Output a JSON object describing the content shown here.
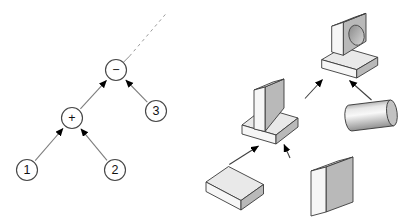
{
  "diagram": {
    "type": "csg-expression-tree",
    "tree_nodes": [
      {
        "id": "minus",
        "label": "−",
        "role": "difference-operator"
      },
      {
        "id": "plus",
        "label": "+",
        "role": "union-operator"
      },
      {
        "id": "one",
        "label": "1",
        "role": "operand"
      },
      {
        "id": "two",
        "label": "2",
        "role": "operand"
      },
      {
        "id": "three",
        "label": "3",
        "role": "operand"
      }
    ],
    "shapes": [
      {
        "id": "base-slab",
        "name": "flat-block-operand-1"
      },
      {
        "id": "upright-slab",
        "name": "upright-block-operand-2"
      },
      {
        "id": "pedestal",
        "name": "union-result-pedestal"
      },
      {
        "id": "cylinder",
        "name": "cylinder-operand-3"
      },
      {
        "id": "result",
        "name": "pedestal-with-hole-result"
      }
    ]
  },
  "colors": {
    "face_front": "#f6f6f6",
    "face_top": "#e9e9e9",
    "face_side": "#b9b9b9"
  }
}
